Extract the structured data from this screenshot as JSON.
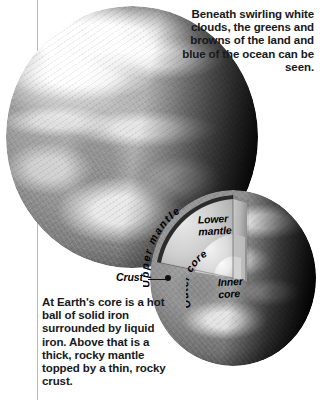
{
  "figure": {
    "type": "earth-cutaway-illustration",
    "background_color": "#ffffff",
    "text_color": "#17191c"
  },
  "callouts": {
    "top_right": "Beneath swirling white clouds, the greens and browns of the land and blue of the ocean can be seen.",
    "bottom_left": "At Earth's core is a hot ball of solid iron surrounded by liquid iron. Above that is a thick, rocky mantle topped by a thin, rocky crust."
  },
  "globes": {
    "main": {
      "name": "earth-full-globe"
    },
    "cutaway": {
      "name": "earth-cutaway-globe"
    }
  },
  "layer_labels": {
    "crust": "Crust",
    "upper_mantle": "Upper mantle",
    "lower_mantle_line1": "Lower",
    "lower_mantle_line2": "mantle",
    "outer_core": "Outer core",
    "inner_core_line1": "Inner",
    "inner_core_line2": "core"
  }
}
